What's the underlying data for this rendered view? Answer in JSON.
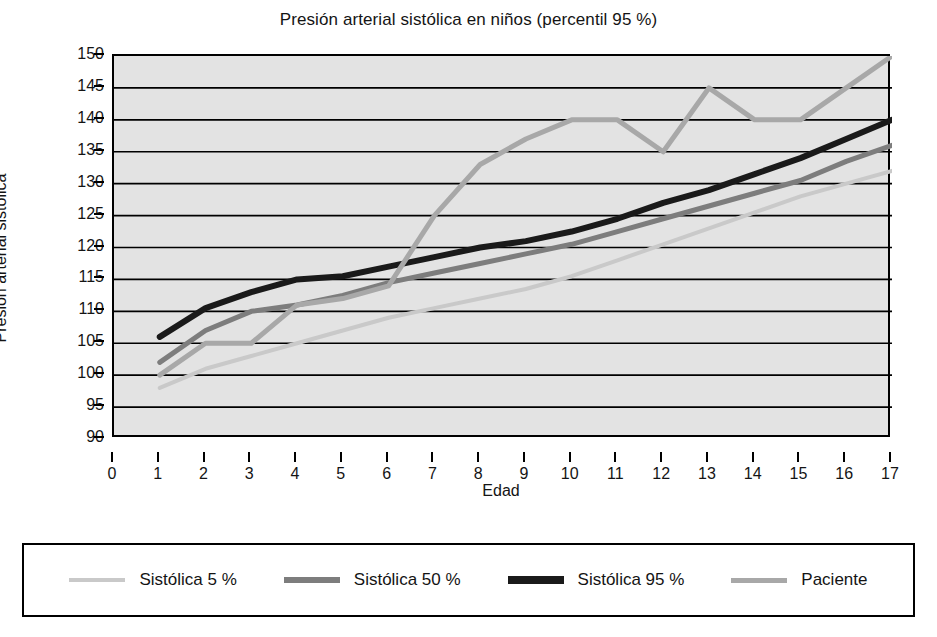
{
  "chart_data": {
    "type": "line",
    "title": "Presión arterial sistólica en niños (percentil 95 %)",
    "xlabel": "Edad",
    "ylabel": "Presión arterial sistólica",
    "xlim": [
      0,
      17
    ],
    "ylim": [
      90,
      150
    ],
    "xticks": [
      0,
      1,
      2,
      3,
      4,
      5,
      6,
      7,
      8,
      9,
      10,
      11,
      12,
      13,
      14,
      15,
      16,
      17
    ],
    "yticks": [
      90,
      95,
      100,
      105,
      110,
      115,
      120,
      125,
      130,
      135,
      140,
      145,
      150
    ],
    "grid": "horizontal",
    "legend_position": "bottom",
    "plot_background": "#e3e3e3",
    "x": [
      1,
      2,
      3,
      4,
      5,
      6,
      7,
      8,
      9,
      10,
      11,
      12,
      13,
      14,
      15,
      16,
      17
    ],
    "series": [
      {
        "name": "Sistólica 5 %",
        "color": "#c9c9c9",
        "width": 4,
        "values": [
          98,
          101,
          103,
          105,
          107,
          109,
          110.5,
          112,
          113.5,
          115.5,
          118,
          120.5,
          123,
          125.5,
          128,
          130,
          132
        ]
      },
      {
        "name": "Sistólica 50 %",
        "color": "#7d7d7d",
        "width": 5,
        "values": [
          102,
          107,
          110,
          111,
          112.5,
          114.5,
          116,
          117.5,
          119,
          120.5,
          122.5,
          124.5,
          126.5,
          128.5,
          130.5,
          133.5,
          136
        ]
      },
      {
        "name": "Sistólica 95 %",
        "color": "#1a1a1a",
        "width": 6,
        "values": [
          106,
          110.5,
          113,
          115,
          115.5,
          117,
          118.5,
          120,
          121,
          122.5,
          124.5,
          127,
          129,
          131.5,
          134,
          137,
          140
        ]
      },
      {
        "name": "Paciente",
        "color": "#a8a8a8",
        "width": 5,
        "values": [
          100,
          105,
          105,
          111,
          112,
          114,
          125,
          133,
          137,
          140,
          140,
          135,
          145,
          140,
          140,
          145,
          150
        ]
      }
    ]
  },
  "legend": {
    "items": [
      {
        "label": "Sistólica 5 %",
        "color": "#c9c9c9",
        "thickness": 4
      },
      {
        "label": "Sistólica 50 %",
        "color": "#7d7d7d",
        "thickness": 6
      },
      {
        "label": "Sistólica 95 %",
        "color": "#1a1a1a",
        "thickness": 8
      },
      {
        "label": "Paciente",
        "color": "#a8a8a8",
        "thickness": 5
      }
    ]
  }
}
